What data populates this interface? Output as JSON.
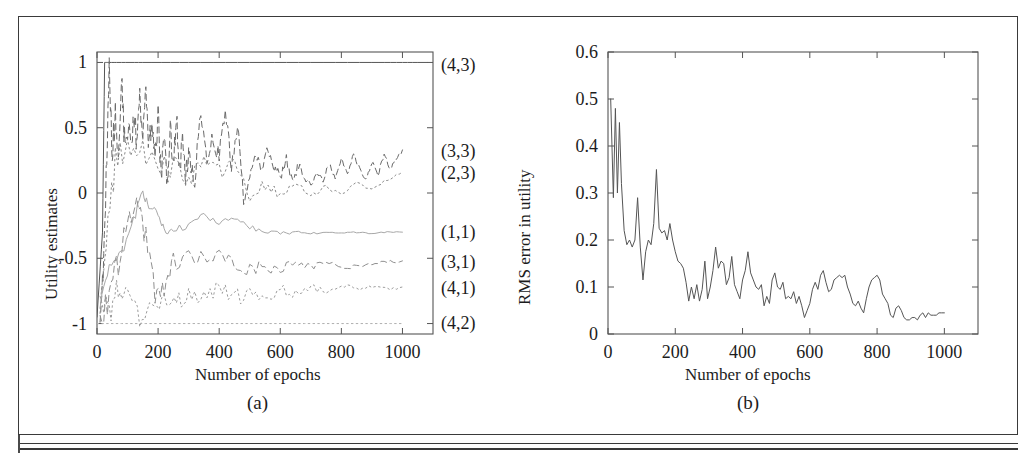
{
  "figure": {
    "panels": [
      {
        "id": "a",
        "caption": "(a)",
        "xlabel": "Number of epochs",
        "ylabel": "Utility estimates"
      },
      {
        "id": "b",
        "caption": "(b)",
        "xlabel": "Number of epochs",
        "ylabel": "RMS error in utility"
      }
    ]
  },
  "chart_data": [
    {
      "type": "line",
      "panel": "a",
      "title": "",
      "xlabel": "Number of epochs",
      "ylabel": "Utility estimates",
      "xlim": [
        0,
        1100
      ],
      "ylim": [
        -1.08,
        1.08
      ],
      "xticks": [
        0,
        200,
        400,
        600,
        800,
        1000
      ],
      "xticklabels": [
        "0",
        "200",
        "400",
        "600",
        "800",
        "1000"
      ],
      "yticks": [
        -1,
        -0.5,
        0,
        0.5,
        1
      ],
      "yticklabels": [
        "-1",
        "-0.5",
        "0",
        "0.5",
        "1"
      ],
      "grid": false,
      "legend_position": "right-outside",
      "series": [
        {
          "name": "(4,3)",
          "label": "(4,3)",
          "style": "solid",
          "color": "#555555",
          "x": [
            0,
            18,
            25,
            40,
            80,
            150,
            300,
            500,
            700,
            900,
            1000,
            1080
          ],
          "values": [
            -0.95,
            -0.3,
            1.0,
            1.0,
            1.0,
            1.0,
            1.0,
            1.0,
            1.0,
            1.0,
            1.0,
            1.0
          ]
        },
        {
          "name": "(3,3)",
          "label": "(3,3)",
          "style": "dashed",
          "color": "#6a6a6a",
          "x": [
            10,
            20,
            30,
            40,
            50,
            60,
            70,
            80,
            90,
            100,
            110,
            120,
            130,
            140,
            150,
            160,
            170,
            180,
            190,
            200,
            210,
            220,
            230,
            240,
            250,
            260,
            270,
            280,
            290,
            300,
            320,
            340,
            360,
            380,
            400,
            420,
            440,
            460,
            480,
            500,
            520,
            540,
            560,
            580,
            600,
            620,
            640,
            660,
            680,
            700,
            720,
            740,
            760,
            780,
            800,
            820,
            840,
            860,
            880,
            900,
            920,
            940,
            960,
            980,
            1000
          ],
          "values": [
            -0.95,
            -0.62,
            0.12,
            0.98,
            0.3,
            0.62,
            0.26,
            0.88,
            0.4,
            0.52,
            0.34,
            0.6,
            0.4,
            0.74,
            0.45,
            0.78,
            0.36,
            0.55,
            0.22,
            0.6,
            0.12,
            0.46,
            0.05,
            0.52,
            0.2,
            0.58,
            0.18,
            0.4,
            0.12,
            0.3,
            0.1,
            0.66,
            0.22,
            0.42,
            0.28,
            0.64,
            0.2,
            0.52,
            -0.05,
            0.1,
            0.3,
            0.18,
            0.34,
            0.2,
            0.12,
            0.26,
            0.08,
            0.22,
            0.12,
            0.05,
            0.16,
            0.1,
            0.22,
            0.12,
            0.26,
            0.14,
            0.3,
            0.18,
            0.1,
            0.24,
            0.14,
            0.3,
            0.18,
            0.26,
            0.33
          ]
        },
        {
          "name": "(2,3)",
          "label": "(2,3)",
          "style": "dotted",
          "color": "#8a8a8a",
          "x": [
            10,
            30,
            60,
            100,
            150,
            200,
            250,
            300,
            350,
            400,
            450,
            500,
            550,
            600,
            650,
            700,
            750,
            800,
            850,
            900,
            950,
            1000
          ],
          "values": [
            -0.9,
            -0.4,
            0.25,
            0.36,
            0.3,
            0.18,
            0.22,
            0.1,
            0.26,
            0.16,
            0.22,
            -0.03,
            0.06,
            0.0,
            0.08,
            -0.02,
            0.05,
            -0.02,
            0.08,
            0.02,
            0.1,
            0.16
          ]
        },
        {
          "name": "(1,1)",
          "label": "(1,1)",
          "style": "solid-light",
          "color": "#a8a8a8",
          "x": [
            10,
            40,
            80,
            120,
            150,
            170,
            200,
            220,
            250,
            300,
            350,
            400,
            450,
            500,
            550,
            600,
            650,
            700,
            750,
            800,
            850,
            900,
            950,
            1000
          ],
          "values": [
            -0.88,
            -0.55,
            -0.48,
            -0.2,
            0.0,
            -0.1,
            -0.14,
            -0.3,
            -0.28,
            -0.26,
            -0.17,
            -0.22,
            -0.21,
            -0.26,
            -0.3,
            -0.31,
            -0.3,
            -0.31,
            -0.3,
            -0.31,
            -0.3,
            -0.31,
            -0.3,
            -0.3
          ]
        },
        {
          "name": "(3,1)",
          "label": "(3,1)",
          "style": "dashed",
          "color": "#8f8f8f",
          "x": [
            10,
            40,
            70,
            100,
            130,
            160,
            190,
            220,
            250,
            300,
            350,
            400,
            450,
            500,
            550,
            600,
            650,
            700,
            750,
            800,
            850,
            900,
            950,
            1000
          ],
          "values": [
            -0.95,
            -0.78,
            -0.52,
            -0.28,
            -0.02,
            -0.35,
            -0.8,
            -0.72,
            -0.55,
            -0.5,
            -0.52,
            -0.5,
            -0.55,
            -0.58,
            -0.56,
            -0.58,
            -0.54,
            -0.57,
            -0.52,
            -0.58,
            -0.56,
            -0.55,
            -0.53,
            -0.52
          ]
        },
        {
          "name": "(4,1)",
          "label": "(4,1)",
          "style": "dotted",
          "color": "#9c9c9c",
          "x": [
            10,
            40,
            70,
            100,
            140,
            180,
            220,
            260,
            300,
            350,
            400,
            450,
            500,
            550,
            600,
            650,
            700,
            750,
            800,
            850,
            900,
            950,
            1000
          ],
          "values": [
            -0.82,
            -0.92,
            -0.7,
            -0.8,
            -0.95,
            -0.88,
            -0.78,
            -0.82,
            -0.76,
            -0.8,
            -0.74,
            -0.8,
            -0.78,
            -0.8,
            -0.74,
            -0.78,
            -0.72,
            -0.76,
            -0.7,
            -0.74,
            -0.72,
            -0.73,
            -0.72
          ]
        },
        {
          "name": "(4,2)",
          "label": "(4,2)",
          "style": "dotted",
          "color": "#b0b0b0",
          "x": [
            0,
            200,
            400,
            600,
            800,
            1000
          ],
          "values": [
            -1.0,
            -1.0,
            -1.0,
            -1.0,
            -1.0,
            -1.0
          ]
        }
      ]
    },
    {
      "type": "line",
      "panel": "b",
      "title": "",
      "xlabel": "Number of epochs",
      "ylabel": "RMS error in utility",
      "xlim": [
        0,
        1100
      ],
      "ylim": [
        0,
        0.6
      ],
      "xticks": [
        0,
        200,
        400,
        600,
        800,
        1000
      ],
      "xticklabels": [
        "0",
        "200",
        "400",
        "600",
        "800",
        "1000"
      ],
      "yticks": [
        0,
        0.1,
        0.2,
        0.3,
        0.4,
        0.5,
        0.6
      ],
      "yticklabels": [
        "0",
        "0.1",
        "0.2",
        "0.3",
        "0.4",
        "0.5",
        "0.6"
      ],
      "grid": false,
      "legend_position": "none",
      "series": [
        {
          "name": "RMS error",
          "label": "RMS error in utility",
          "style": "solid",
          "color": "#555555",
          "x": [
            8,
            16,
            22,
            28,
            34,
            40,
            48,
            56,
            64,
            72,
            80,
            88,
            96,
            104,
            112,
            120,
            128,
            136,
            144,
            152,
            160,
            168,
            176,
            184,
            192,
            200,
            208,
            216,
            224,
            232,
            240,
            248,
            256,
            264,
            272,
            280,
            288,
            296,
            304,
            312,
            320,
            328,
            336,
            344,
            352,
            360,
            368,
            376,
            384,
            392,
            400,
            408,
            416,
            424,
            432,
            440,
            448,
            456,
            464,
            472,
            480,
            488,
            496,
            504,
            512,
            520,
            528,
            536,
            544,
            552,
            560,
            568,
            576,
            584,
            592,
            600,
            608,
            616,
            624,
            632,
            640,
            648,
            656,
            664,
            672,
            680,
            688,
            696,
            704,
            712,
            720,
            728,
            736,
            744,
            752,
            760,
            768,
            776,
            784,
            792,
            800,
            808,
            816,
            824,
            832,
            840,
            848,
            856,
            864,
            872,
            880,
            888,
            896,
            904,
            912,
            920,
            928,
            936,
            944,
            952,
            960,
            968,
            976,
            984,
            992,
            1000
          ],
          "values": [
            0.5,
            0.29,
            0.48,
            0.3,
            0.45,
            0.32,
            0.22,
            0.19,
            0.2,
            0.185,
            0.2,
            0.29,
            0.185,
            0.115,
            0.175,
            0.2,
            0.19,
            0.235,
            0.35,
            0.225,
            0.215,
            0.22,
            0.2,
            0.235,
            0.2,
            0.175,
            0.155,
            0.15,
            0.14,
            0.11,
            0.07,
            0.1,
            0.075,
            0.105,
            0.07,
            0.095,
            0.155,
            0.075,
            0.1,
            0.135,
            0.185,
            0.14,
            0.155,
            0.15,
            0.105,
            0.12,
            0.165,
            0.105,
            0.09,
            0.075,
            0.115,
            0.135,
            0.175,
            0.13,
            0.115,
            0.1,
            0.095,
            0.105,
            0.06,
            0.08,
            0.065,
            0.115,
            0.13,
            0.1,
            0.095,
            0.11,
            0.075,
            0.08,
            0.075,
            0.09,
            0.065,
            0.08,
            0.06,
            0.035,
            0.05,
            0.065,
            0.095,
            0.11,
            0.095,
            0.125,
            0.135,
            0.11,
            0.09,
            0.095,
            0.115,
            0.12,
            0.125,
            0.12,
            0.125,
            0.1,
            0.085,
            0.065,
            0.06,
            0.07,
            0.055,
            0.045,
            0.075,
            0.1,
            0.115,
            0.12,
            0.125,
            0.115,
            0.085,
            0.075,
            0.065,
            0.04,
            0.035,
            0.055,
            0.06,
            0.05,
            0.035,
            0.03,
            0.03,
            0.035,
            0.035,
            0.03,
            0.04,
            0.045,
            0.035,
            0.045,
            0.04,
            0.04,
            0.04,
            0.045,
            0.045,
            0.045
          ]
        }
      ]
    }
  ]
}
